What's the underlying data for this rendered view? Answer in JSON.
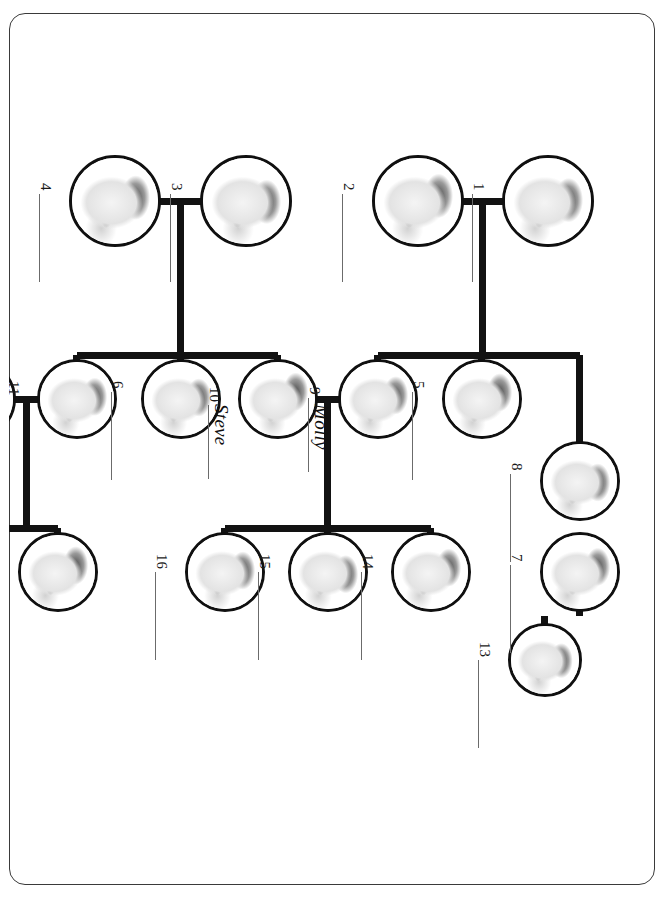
{
  "worksheet": {
    "top_note": "",
    "border_color": "#3a3a3a"
  },
  "diagram": {
    "type": "family-tree",
    "orientation": "rotated-90-clockwise",
    "line_color": "#121212",
    "node_border_color": "#101010",
    "node_fill": "#ffffff",
    "people": [
      {
        "id": 1,
        "label": "1",
        "name": "",
        "cx": 188,
        "cy": 107,
        "r": 46
      },
      {
        "id": 2,
        "label": "2",
        "name": "",
        "cx": 188,
        "cy": 237,
        "r": 46
      },
      {
        "id": 3,
        "label": "3",
        "name": "",
        "cx": 188,
        "cy": 409,
        "r": 46
      },
      {
        "id": 4,
        "label": "4",
        "name": "",
        "cx": 188,
        "cy": 540,
        "r": 46
      },
      {
        "id": 5,
        "label": "5",
        "name": "",
        "cx": 386,
        "cy": 173,
        "r": 40
      },
      {
        "id": 6,
        "label": "6",
        "name": "",
        "cx": 386,
        "cy": 474,
        "r": 40
      },
      {
        "id": 7,
        "label": "7",
        "name": "",
        "cx": 559,
        "cy": 75,
        "r": 40
      },
      {
        "id": 8,
        "label": "8",
        "name": "",
        "cx": 468,
        "cy": 75,
        "r": 40
      },
      {
        "id": 9,
        "label": "9",
        "name": "Molly",
        "cx": 386,
        "cy": 277,
        "r": 40
      },
      {
        "id": 10,
        "label": "10",
        "name": "Steve",
        "cx": 386,
        "cy": 377,
        "r": 40
      },
      {
        "id": 11,
        "label": "11",
        "name": "",
        "cx": 386,
        "cy": 578,
        "r": 40
      },
      {
        "id": 12,
        "label": "12",
        "name": "",
        "cx": 386,
        "cy": 679,
        "r": 40
      },
      {
        "id": 13,
        "label": "13",
        "name": "",
        "cx": 647,
        "cy": 110,
        "r": 37
      },
      {
        "id": 14,
        "label": "14",
        "name": "",
        "cx": 559,
        "cy": 224,
        "r": 40
      },
      {
        "id": 15,
        "label": "15",
        "name": "",
        "cx": 559,
        "cy": 327,
        "r": 40
      },
      {
        "id": 16,
        "label": "16",
        "name": "",
        "cx": 559,
        "cy": 430,
        "r": 40
      },
      {
        "id": 17,
        "label": "17",
        "name": "",
        "cx": 559,
        "cy": 597,
        "r": 40
      },
      {
        "id": 18,
        "label": "18",
        "name": "",
        "cx": 559,
        "cy": 700,
        "r": 40
      }
    ],
    "couples": [
      {
        "partners": [
          1,
          2
        ],
        "children": [
          5,
          8,
          9
        ]
      },
      {
        "partners": [
          3,
          4
        ],
        "children": [
          6,
          10,
          11
        ]
      },
      {
        "partners": [
          9,
          10
        ],
        "children": [
          14,
          15,
          16
        ]
      },
      {
        "partners": [
          11,
          12
        ],
        "children": [
          17,
          18
        ]
      },
      {
        "partners": [
          7,
          8
        ],
        "children": [
          13
        ]
      }
    ],
    "label_rule_color": "#6b6b6b"
  }
}
